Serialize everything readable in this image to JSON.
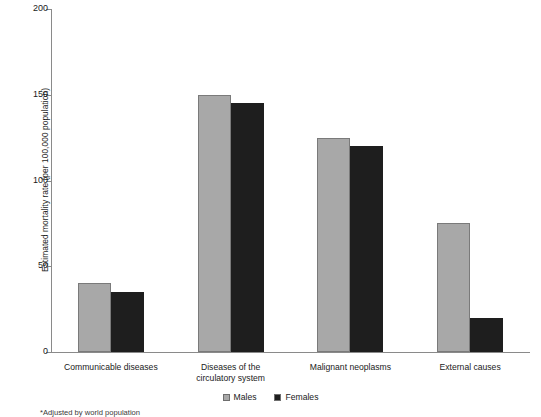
{
  "chart_data": {
    "type": "bar",
    "title": "",
    "xlabel": "",
    "ylabel": "Estimated mortality rate (per 100,000 population)",
    "ylim": [
      0,
      200
    ],
    "yticks": [
      0,
      50,
      100,
      150,
      200
    ],
    "grid": false,
    "legend_position": "bottom-center",
    "categories": [
      "Communicable diseases",
      "Diseases of the circulatory system",
      "Malignant neoplasms",
      "External causes"
    ],
    "category_lines": [
      [
        "Communicable diseases"
      ],
      [
        "Diseases of the",
        "circulatory system"
      ],
      [
        "Malignant neoplasms"
      ],
      [
        "External causes"
      ]
    ],
    "series": [
      {
        "name": "Males",
        "color": "#a8a8a8",
        "values": [
          40,
          150,
          125,
          75
        ]
      },
      {
        "name": "Females",
        "color": "#1e1e1e",
        "values": [
          35,
          145,
          120,
          20
        ]
      }
    ],
    "annotations": [
      "*Adjusted by world population"
    ]
  },
  "legend": {
    "items": [
      {
        "label": "Males",
        "color": "#a8a8a8"
      },
      {
        "label": "Females",
        "color": "#1e1e1e"
      }
    ]
  },
  "footnote": "*Adjusted by world population",
  "axis": {
    "y_title": "Estimated mortality rate (per 100,000 population)",
    "y_tick_labels": [
      "0",
      "50",
      "100",
      "150",
      "200"
    ]
  }
}
